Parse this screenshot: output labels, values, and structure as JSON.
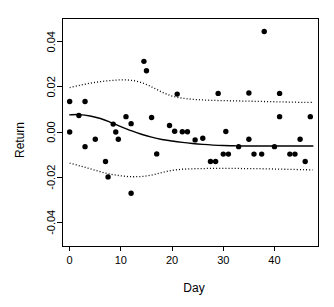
{
  "chart_data": {
    "type": "scatter",
    "title": "",
    "xlabel": "Day",
    "ylabel": "Return",
    "xlim": [
      -1.5,
      48.5
    ],
    "ylim": [
      -0.0505,
      0.0505
    ],
    "xticks": [
      0,
      10,
      20,
      30,
      40
    ],
    "xtick_labels": [
      "0",
      "10",
      "20",
      "30",
      "40"
    ],
    "yticks": [
      0.04,
      0.02,
      0.0,
      -0.02,
      -0.04
    ],
    "ytick_labels": [
      "0.04",
      "0.02",
      "0.00",
      "-0.02",
      "-0.04"
    ],
    "grid": false,
    "legend": null,
    "point_color": "#000000",
    "line_color": "#000000",
    "background": "#ffffff",
    "points": [
      {
        "x": 0,
        "y": 0.0135
      },
      {
        "x": 0,
        "y": 0.0
      },
      {
        "x": 1.8,
        "y": 0.0073
      },
      {
        "x": 3,
        "y": 0.0135
      },
      {
        "x": 3,
        "y": -0.0065
      },
      {
        "x": 5,
        "y": -0.0032
      },
      {
        "x": 7,
        "y": -0.0131
      },
      {
        "x": 7.5,
        "y": -0.0199
      },
      {
        "x": 8.5,
        "y": 0.0035
      },
      {
        "x": 9,
        "y": 0.0
      },
      {
        "x": 9.5,
        "y": -0.0032
      },
      {
        "x": 11,
        "y": 0.0068
      },
      {
        "x": 12,
        "y": 0.0037
      },
      {
        "x": 12,
        "y": -0.0271
      },
      {
        "x": 14.5,
        "y": 0.0313
      },
      {
        "x": 15,
        "y": 0.0271
      },
      {
        "x": 16,
        "y": 0.0064
      },
      {
        "x": 17,
        "y": -0.0097
      },
      {
        "x": 19.5,
        "y": 0.0029
      },
      {
        "x": 20.5,
        "y": 0.0003
      },
      {
        "x": 21,
        "y": 0.0168
      },
      {
        "x": 22,
        "y": 0.0001
      },
      {
        "x": 23,
        "y": 0.0001
      },
      {
        "x": 24.5,
        "y": -0.0035
      },
      {
        "x": 26,
        "y": -0.0028
      },
      {
        "x": 27.5,
        "y": -0.0131
      },
      {
        "x": 28.5,
        "y": -0.0131
      },
      {
        "x": 29,
        "y": 0.0171
      },
      {
        "x": 30.5,
        "y": 0.0002
      },
      {
        "x": 30,
        "y": -0.0098
      },
      {
        "x": 31,
        "y": -0.0098
      },
      {
        "x": 33,
        "y": -0.0065
      },
      {
        "x": 35,
        "y": -0.0032
      },
      {
        "x": 35,
        "y": 0.0173
      },
      {
        "x": 36,
        "y": -0.0098
      },
      {
        "x": 37.5,
        "y": -0.0098
      },
      {
        "x": 38,
        "y": 0.0445
      },
      {
        "x": 40,
        "y": -0.0065
      },
      {
        "x": 41,
        "y": 0.0068
      },
      {
        "x": 41,
        "y": 0.0171
      },
      {
        "x": 43,
        "y": -0.0098
      },
      {
        "x": 44,
        "y": -0.0098
      },
      {
        "x": 45,
        "y": -0.0032
      },
      {
        "x": 46,
        "y": -0.0131
      },
      {
        "x": 47,
        "y": 0.0068
      }
    ],
    "fit_curve": {
      "name": "loess-fit",
      "style": "solid",
      "x": [
        0,
        2,
        4,
        6,
        8,
        10,
        12,
        14,
        16,
        18,
        20,
        22,
        24,
        26,
        28,
        30,
        32,
        34,
        36,
        38,
        40,
        42,
        44,
        46,
        47.5
      ],
      "y": [
        0.0076,
        0.0077,
        0.0071,
        0.006,
        0.0043,
        0.0024,
        0.0006,
        -0.001,
        -0.0023,
        -0.0033,
        -0.004,
        -0.0046,
        -0.0051,
        -0.0055,
        -0.0058,
        -0.006,
        -0.0061,
        -0.0062,
        -0.0062,
        -0.0062,
        -0.0062,
        -0.0062,
        -0.0062,
        -0.0062,
        -0.0062
      ]
    },
    "upper_band": {
      "name": "upper-confidence-band",
      "style": "dotted",
      "x": [
        0,
        2,
        4,
        6,
        8,
        10,
        12,
        14,
        16,
        18,
        20,
        22,
        24,
        26,
        28,
        30,
        32,
        34,
        36,
        38,
        40,
        42,
        44,
        46,
        47.5
      ],
      "y": [
        0.0197,
        0.0207,
        0.0216,
        0.0223,
        0.0228,
        0.0231,
        0.0229,
        0.0219,
        0.02,
        0.0177,
        0.0159,
        0.015,
        0.0145,
        0.0142,
        0.014,
        0.0139,
        0.0138,
        0.0137,
        0.0136,
        0.0135,
        0.0134,
        0.0133,
        0.0132,
        0.0131,
        0.0131
      ]
    },
    "lower_band": {
      "name": "lower-confidence-band",
      "style": "dotted",
      "x": [
        0,
        2,
        4,
        6,
        8,
        10,
        12,
        14,
        16,
        18,
        20,
        22,
        24,
        26,
        28,
        30,
        32,
        34,
        36,
        38,
        40,
        42,
        44,
        46,
        47.5
      ],
      "y": [
        -0.0138,
        -0.015,
        -0.0163,
        -0.0176,
        -0.0187,
        -0.0194,
        -0.0198,
        -0.0197,
        -0.0191,
        -0.018,
        -0.017,
        -0.0165,
        -0.0163,
        -0.0162,
        -0.0161,
        -0.0161,
        -0.0161,
        -0.0162,
        -0.0162,
        -0.0163,
        -0.0164,
        -0.0165,
        -0.0166,
        -0.0167,
        -0.0168
      ]
    }
  }
}
